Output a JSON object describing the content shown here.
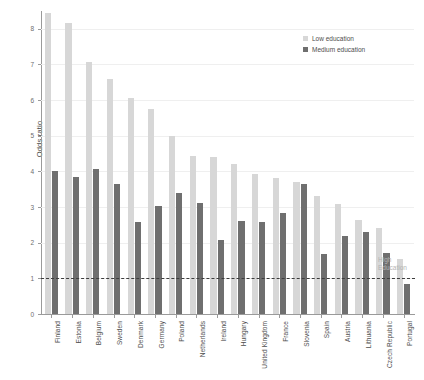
{
  "chart_data": {
    "type": "bar",
    "title": "",
    "xlabel": "",
    "ylabel": "Odds ratio",
    "ylim": [
      0,
      8.5
    ],
    "yticks": [
      0,
      1,
      2,
      3,
      4,
      5,
      6,
      7,
      8
    ],
    "ytick_labels": [
      "0",
      "1",
      "2",
      "3",
      "4",
      "5",
      "6",
      "7",
      "8"
    ],
    "grid": true,
    "legend_position": "top-right",
    "categories": [
      "Finland",
      "Estonia",
      "Belgium",
      "Sweden",
      "Denmark",
      "Germany",
      "Poland",
      "Netherlands",
      "Ireland",
      "Hungary",
      "United Kingdom",
      "France",
      "Slovenia",
      "Spain",
      "Austria",
      "Lithuania",
      "Czech Republic",
      "Portugal"
    ],
    "series": [
      {
        "name": "Low education",
        "color": "#d7d7d7",
        "values": [
          8.45,
          8.15,
          7.08,
          6.6,
          6.05,
          5.75,
          5.0,
          4.42,
          4.4,
          4.2,
          3.92,
          3.82,
          3.7,
          3.32,
          3.1,
          2.65,
          2.42,
          1.55
        ]
      },
      {
        "name": "Medium education",
        "color": "#6f6f6f",
        "values": [
          4.0,
          3.85,
          4.08,
          3.65,
          2.58,
          3.02,
          3.4,
          3.12,
          2.08,
          2.62,
          2.58,
          2.82,
          3.65,
          1.68,
          2.18,
          2.3,
          1.72,
          0.85
        ]
      }
    ],
    "reference_line": {
      "value": 1,
      "style": "dashed",
      "annotation": "High Education",
      "annotation_lines": [
        "High",
        "Education"
      ]
    }
  },
  "legend": {
    "items": [
      {
        "label": "Low education",
        "swatch": "low"
      },
      {
        "label": "Medium education",
        "swatch": "med"
      }
    ]
  }
}
